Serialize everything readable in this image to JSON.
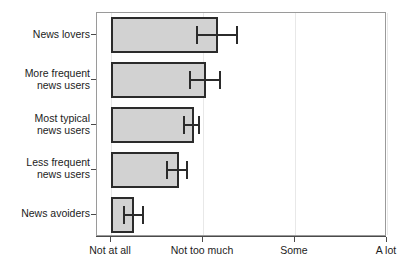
{
  "chart_data": {
    "type": "bar",
    "orientation": "horizontal",
    "title": "",
    "xlabel": "",
    "ylabel": "",
    "grid": "vertical",
    "legend": "none",
    "xtick_labels": [
      "Not at all",
      "Not too much",
      "Some",
      "A lot"
    ],
    "xtick_values": [
      0,
      1,
      2,
      3
    ],
    "xlim": [
      -0.15,
      3.0
    ],
    "categories": [
      "News lovers",
      "More frequent\nnews users",
      "Most typical\nnews users",
      "Less frequent\nnews users",
      "News avoiders"
    ],
    "values": [
      1.16,
      1.03,
      0.9,
      0.74,
      0.25
    ],
    "error_low": [
      0.93,
      0.85,
      0.78,
      0.6,
      0.13
    ],
    "error_high": [
      1.39,
      1.2,
      0.97,
      0.84,
      0.36
    ],
    "bar_fill_color": "#d2d2d2",
    "bar_edge_color": "#2b2b2b",
    "error_bar_color": "#2b2b2b",
    "grid_color": "#e8e8e8",
    "axis_color": "#9a9a9a",
    "background_color": "#ffffff"
  }
}
